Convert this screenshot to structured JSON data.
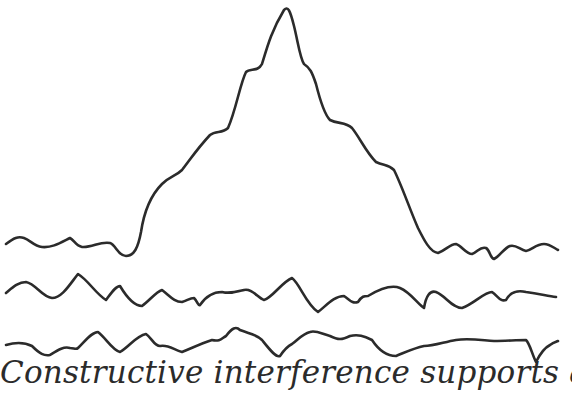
{
  "diagram": {
    "title": "Constructive interference",
    "waves": [
      {
        "name": "summed-peak-wave",
        "description": "resulting wave with large central peak"
      },
      {
        "name": "component-wave-1",
        "description": "noisy component wave"
      },
      {
        "name": "component-wave-2",
        "description": "noisy component wave"
      }
    ],
    "stroke_color": "#2b2b2b",
    "background_color": "#ffffff"
  },
  "caption": {
    "text": "Constructive interference supports and"
  }
}
